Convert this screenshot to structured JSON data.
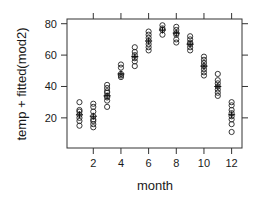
{
  "chart_data": {
    "type": "scatter",
    "title": "",
    "xlabel": "month",
    "ylabel": "temp + fitted(mod2)",
    "xlim": [
      0.1,
      12.75
    ],
    "ylim": [
      0.8,
      83
    ],
    "x_ticks": [
      2,
      4,
      6,
      8,
      10,
      12
    ],
    "y_ticks": [
      20,
      40,
      60,
      80
    ],
    "grid": false,
    "legend": null,
    "series": [
      {
        "name": "observed",
        "marker": "open-circle",
        "points": [
          {
            "month": 1,
            "values": [
              30,
              25,
              24,
              22,
              20,
              18,
              15
            ]
          },
          {
            "month": 2,
            "values": [
              29,
              27,
              24,
              21,
              19,
              18,
              16,
              14
            ]
          },
          {
            "month": 3,
            "values": [
              41,
              39,
              37,
              36,
              34,
              33,
              31,
              27
            ]
          },
          {
            "month": 4,
            "values": [
              54,
              52,
              48,
              47,
              46
            ]
          },
          {
            "month": 5,
            "values": [
              65,
              62,
              60,
              58,
              56,
              53
            ]
          },
          {
            "month": 6,
            "values": [
              75,
              73,
              71,
              69,
              67,
              65,
              63
            ]
          },
          {
            "month": 7,
            "values": [
              79,
              77,
              76,
              73
            ]
          },
          {
            "month": 8,
            "values": [
              78,
              76,
              74,
              73,
              70,
              68
            ]
          },
          {
            "month": 9,
            "values": [
              72,
              70,
              68,
              67,
              65,
              63
            ]
          },
          {
            "month": 10,
            "values": [
              59,
              57,
              55,
              53,
              51,
              49,
              47
            ]
          },
          {
            "month": 11,
            "values": [
              48,
              44,
              42,
              40,
              38,
              36,
              34
            ]
          },
          {
            "month": 12,
            "values": [
              30,
              28,
              25,
              23,
              21,
              19,
              16,
              11
            ]
          }
        ]
      },
      {
        "name": "fitted",
        "marker": "plus",
        "points": [
          {
            "month": 1,
            "value": 22
          },
          {
            "month": 2,
            "value": 21
          },
          {
            "month": 3,
            "value": 34
          },
          {
            "month": 4,
            "value": 48
          },
          {
            "month": 5,
            "value": 59
          },
          {
            "month": 6,
            "value": 69
          },
          {
            "month": 7,
            "value": 76
          },
          {
            "month": 8,
            "value": 74
          },
          {
            "month": 9,
            "value": 67
          },
          {
            "month": 10,
            "value": 53
          },
          {
            "month": 11,
            "value": 40
          },
          {
            "month": 12,
            "value": 22
          }
        ]
      }
    ]
  }
}
